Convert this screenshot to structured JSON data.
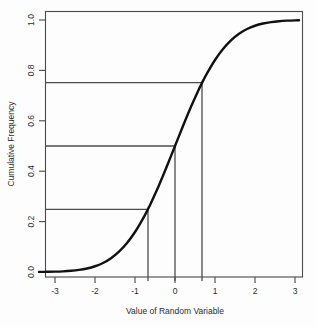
{
  "chart_data": {
    "type": "line",
    "title": "",
    "subtitle": "",
    "xlabel": "Value of Random Variable",
    "ylabel": "Cumulative Frequency",
    "xlim": [
      -3.4,
      3.2
    ],
    "ylim": [
      -0.03,
      1.05
    ],
    "grid": false,
    "legend": null,
    "legend_position": "none",
    "xticks": [
      -3,
      -2,
      -1,
      0,
      1,
      2,
      3
    ],
    "xtick_labels": [
      "-3",
      "-2",
      "-1",
      "0",
      "1",
      "2",
      "3"
    ],
    "yticks": [
      0.0,
      0.2,
      0.4,
      0.6,
      0.8,
      1.0
    ],
    "ytick_labels": [
      "0.0",
      "0.2",
      "0.4",
      "0.6",
      "0.8",
      "1.0"
    ],
    "series": [
      {
        "name": "Normal cumulative distribution function",
        "x": [
          -3.4,
          -3.2,
          -3.0,
          -2.8,
          -2.6,
          -2.4,
          -2.2,
          -2.0,
          -1.8,
          -1.6,
          -1.4,
          -1.2,
          -1.0,
          -0.8,
          -0.674,
          -0.6,
          -0.4,
          -0.2,
          0.0,
          0.2,
          0.4,
          0.6,
          0.674,
          0.8,
          1.0,
          1.2,
          1.4,
          1.6,
          1.8,
          2.0,
          2.2,
          2.4,
          2.6,
          2.8,
          3.0,
          3.1
        ],
        "y": [
          0.0003,
          0.0007,
          0.0013,
          0.0026,
          0.0047,
          0.0082,
          0.0139,
          0.0228,
          0.0359,
          0.0548,
          0.0808,
          0.1151,
          0.1587,
          0.2119,
          0.25,
          0.2743,
          0.3446,
          0.4207,
          0.5,
          0.5793,
          0.6554,
          0.7257,
          0.75,
          0.7881,
          0.8413,
          0.8849,
          0.9192,
          0.9452,
          0.9641,
          0.9772,
          0.9861,
          0.9918,
          0.9953,
          0.9974,
          0.9987,
          0.999
        ]
      }
    ],
    "annotations": [
      {
        "name": "first-quartile",
        "label": "Q1",
        "cumulative_frequency": 0.25,
        "value_of_random_variable": -0.674,
        "horizontal_line_from_x": -3.4,
        "vertical_line_to_y": 0.0
      },
      {
        "name": "median",
        "label": "Q2",
        "cumulative_frequency": 0.5,
        "value_of_random_variable": 0.0,
        "horizontal_line_from_x": -3.4,
        "vertical_line_to_y": 0.0
      },
      {
        "name": "third-quartile",
        "label": "Q3",
        "cumulative_frequency": 0.75,
        "value_of_random_variable": 0.674,
        "horizontal_line_from_x": -3.4,
        "vertical_line_to_y": 0.0
      }
    ],
    "colors": {
      "curve": "#111111",
      "quartile_lines": "#4d4d4d",
      "axes": "#4a4a4a",
      "text": "#2b2b2b",
      "background": "#fdfdfd"
    }
  }
}
